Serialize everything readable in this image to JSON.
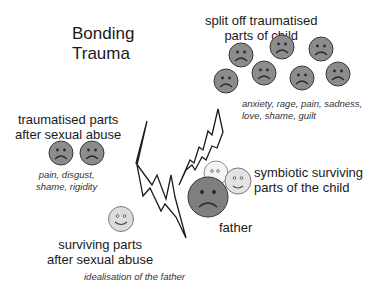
{
  "title": [
    "Bonding",
    "Trauma"
  ],
  "groups": {
    "split_off": {
      "heading": [
        "split off traumatised",
        "parts of child"
      ],
      "note": [
        "anxiety, rage, pain, sadness,",
        "love, shame, guilt"
      ],
      "face_count": 7,
      "face_type": "sad"
    },
    "traumatised_after_abuse": {
      "heading": [
        "traumatised parts",
        "after sexual abuse"
      ],
      "note": [
        "pain, disgust,",
        "shame, rigidity"
      ],
      "face_count": 2,
      "face_type": "sad"
    },
    "surviving_after_abuse": {
      "heading": [
        "surviving parts",
        "after sexual abuse"
      ],
      "note": [
        "idealisation of the father"
      ],
      "face_count": 1,
      "face_type": "happy"
    },
    "symbiotic": {
      "heading": [
        "symbiotic surviving",
        "parts of the child"
      ],
      "face_count": 2,
      "face_type": "neutral/happy"
    },
    "father": {
      "label": "father",
      "face_type": "sad"
    }
  },
  "colors": {
    "sad_face": "#8c8c8c",
    "father_face": "#7f7f7f",
    "light_face": "#dcdcdc",
    "outline": "#3a3a3a",
    "bolt_stroke": "#1a1a1a"
  },
  "symbols": [
    "lightning-bolt-left",
    "lightning-bolt-right"
  ]
}
